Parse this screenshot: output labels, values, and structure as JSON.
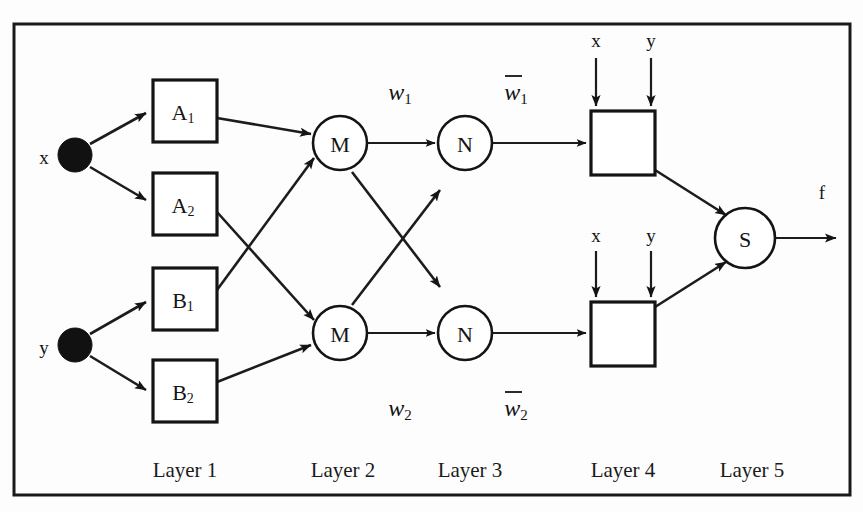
{
  "diagram": {
    "type": "neural-fuzzy-network",
    "background_color": "#fdfdfd",
    "line_color": "#1a1a1a",
    "node_fill": "#ffffff",
    "input_dot_color": "#111111"
  },
  "inputs": [
    {
      "id": "x",
      "label": "x",
      "cx": 75,
      "cy": 155
    },
    {
      "id": "y",
      "label": "y",
      "cx": 75,
      "cy": 345
    }
  ],
  "layer1": {
    "name": "Layer 1",
    "nodes": [
      {
        "id": "A1",
        "label": "A",
        "subscript": "1",
        "x": 153,
        "y": 80,
        "w": 64,
        "h": 62
      },
      {
        "id": "A2",
        "label": "A",
        "subscript": "2",
        "x": 153,
        "y": 173,
        "w": 64,
        "h": 62
      },
      {
        "id": "B1",
        "label": "B",
        "subscript": "1",
        "x": 153,
        "y": 268,
        "w": 64,
        "h": 62
      },
      {
        "id": "B2",
        "label": "B",
        "subscript": "2",
        "x": 153,
        "y": 360,
        "w": 64,
        "h": 62
      }
    ]
  },
  "layer2": {
    "name": "Layer 2",
    "nodes": [
      {
        "id": "M1",
        "label": "M",
        "cx": 340,
        "cy": 143,
        "r": 27
      },
      {
        "id": "M2",
        "label": "M",
        "cx": 340,
        "cy": 333,
        "r": 27
      }
    ]
  },
  "layer3": {
    "name": "Layer 3",
    "nodes": [
      {
        "id": "N1",
        "label": "N",
        "cx": 465,
        "cy": 143,
        "r": 27
      },
      {
        "id": "N2",
        "label": "N",
        "cx": 465,
        "cy": 333,
        "r": 27
      }
    ]
  },
  "layer4": {
    "name": "Layer 4",
    "nodes": [
      {
        "id": "C1",
        "x": 591,
        "y": 111,
        "w": 64,
        "h": 64,
        "inputs": [
          "x",
          "y"
        ]
      },
      {
        "id": "C2",
        "x": 591,
        "y": 302,
        "w": 64,
        "h": 64,
        "inputs": [
          "x",
          "y"
        ]
      }
    ],
    "top_input_labels": [
      {
        "label": "x",
        "x": 591,
        "y": 40
      },
      {
        "label": "y",
        "x": 655,
        "y": 40
      },
      {
        "label": "x",
        "x": 591,
        "y": 235
      },
      {
        "label": "y",
        "x": 655,
        "y": 235
      }
    ]
  },
  "layer5": {
    "name": "Layer 5",
    "nodes": [
      {
        "id": "S",
        "label": "S",
        "cx": 745,
        "cy": 238,
        "r": 30
      }
    ]
  },
  "output": {
    "label": "f",
    "x": 822,
    "y": 190
  },
  "weights": [
    {
      "id": "w1",
      "base": "w",
      "subscript": "1",
      "overbar": false,
      "x": 400,
      "y": 92
    },
    {
      "id": "w2",
      "base": "w",
      "subscript": "2",
      "overbar": false,
      "x": 400,
      "y": 408
    },
    {
      "id": "w1bar",
      "base": "w",
      "subscript": "1",
      "overbar": true,
      "x": 516,
      "y": 92
    },
    {
      "id": "w2bar",
      "base": "w",
      "subscript": "2",
      "overbar": true,
      "x": 516,
      "y": 408
    }
  ],
  "layer_labels": [
    {
      "label": "Layer 1",
      "x": 185,
      "y": 470
    },
    {
      "label": "Layer 2",
      "x": 343,
      "y": 470
    },
    {
      "label": "Layer 3",
      "x": 470,
      "y": 470
    },
    {
      "label": "Layer 4",
      "x": 623,
      "y": 470
    },
    {
      "label": "Layer 5",
      "x": 752,
      "y": 470
    }
  ],
  "frame": {
    "x": 14,
    "y": 24,
    "w": 836,
    "h": 471
  },
  "edges": [
    {
      "from": "x",
      "to": "A1"
    },
    {
      "from": "x",
      "to": "A2"
    },
    {
      "from": "y",
      "to": "B1"
    },
    {
      "from": "y",
      "to": "B2"
    },
    {
      "from": "A1",
      "to": "M1"
    },
    {
      "from": "B1",
      "to": "M1"
    },
    {
      "from": "A2",
      "to": "M2"
    },
    {
      "from": "B2",
      "to": "M2"
    },
    {
      "from": "M1",
      "to": "N1"
    },
    {
      "from": "M2",
      "to": "N2"
    },
    {
      "from": "M1",
      "to": "N2"
    },
    {
      "from": "M2",
      "to": "N1"
    },
    {
      "from": "N1",
      "to": "C1"
    },
    {
      "from": "N2",
      "to": "C2"
    },
    {
      "from": "C1",
      "to": "S"
    },
    {
      "from": "C2",
      "to": "S"
    },
    {
      "from": "S",
      "to": "f"
    }
  ]
}
